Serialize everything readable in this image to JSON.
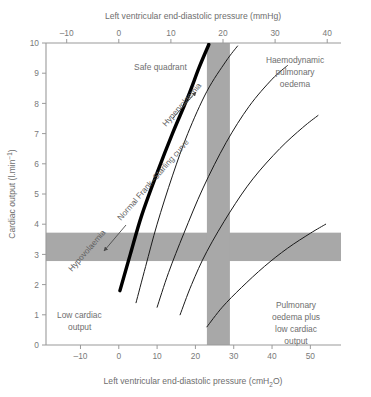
{
  "chart_data": {
    "type": "line",
    "title": "",
    "top_axis": {
      "label": "Left ventricular end-diastolic pressure (mmHg)",
      "ticks": [
        -10,
        0,
        10,
        20,
        30,
        40
      ],
      "range": [
        -14,
        43
      ]
    },
    "bottom_axis": {
      "label": "Left ventricular end-diastolic pressure (cmH₂O)",
      "label_main": "Left ventricular end-diastolic pressure (cmH",
      "label_sub": "2",
      "label_tail": "O)",
      "ticks": [
        -10,
        0,
        10,
        20,
        30,
        40,
        50
      ],
      "range": [
        -19,
        58
      ]
    },
    "ylabel": "Cardiac output (l.min",
    "ylabel_sup": "−1",
    "ylabel_tail": ")",
    "ylabel_full": "Cardiac output (l.min⁻¹)",
    "yticks": [
      0,
      1,
      2,
      3,
      4,
      5,
      6,
      7,
      8,
      9,
      10
    ],
    "ylim": [
      0,
      10
    ],
    "grid": false,
    "legend": "none",
    "bands": {
      "color": "#a8a8a8",
      "horizontal_band": {
        "y_low": 2.78,
        "y_high": 3.72,
        "meaning": "normal cardiac output range"
      },
      "vertical_band": {
        "x_low_cmH2O": 23.0,
        "x_high_cmH2O": 29.0,
        "meaning": "normal LVEDP range"
      }
    },
    "series": [
      {
        "name": "Normal Frank–Starling curve",
        "style": "thick",
        "color": "#000000",
        "width": 3.4,
        "points_cmH2O": [
          [
            0.3,
            1.8
          ],
          [
            3,
            3.0
          ],
          [
            6,
            4.3
          ],
          [
            10,
            5.7
          ],
          [
            14,
            7.0
          ],
          [
            18,
            8.2
          ],
          [
            21,
            9.2
          ],
          [
            23.5,
            9.95
          ]
        ]
      },
      {
        "name": "depressed-curve-1",
        "style": "thin",
        "color": "#1a1a1a",
        "width": 1.0,
        "points_cmH2O": [
          [
            4.5,
            1.4
          ],
          [
            7,
            2.6
          ],
          [
            10,
            4.0
          ],
          [
            14,
            5.6
          ],
          [
            18,
            7.0
          ],
          [
            23,
            8.4
          ],
          [
            28,
            9.4
          ],
          [
            31,
            9.9
          ]
        ]
      },
      {
        "name": "depressed-curve-2",
        "style": "thin",
        "color": "#1a1a1a",
        "width": 1.0,
        "points_cmH2O": [
          [
            10,
            1.25
          ],
          [
            13,
            2.4
          ],
          [
            17,
            3.7
          ],
          [
            22,
            5.2
          ],
          [
            28,
            6.7
          ],
          [
            34,
            7.9
          ],
          [
            40,
            8.8
          ],
          [
            44,
            9.25
          ]
        ]
      },
      {
        "name": "depressed-curve-3",
        "style": "thin",
        "color": "#1a1a1a",
        "width": 1.0,
        "points_cmH2O": [
          [
            16,
            1.0
          ],
          [
            19,
            2.0
          ],
          [
            23,
            3.1
          ],
          [
            29,
            4.4
          ],
          [
            35,
            5.5
          ],
          [
            42,
            6.5
          ],
          [
            48,
            7.2
          ],
          [
            52,
            7.6
          ]
        ]
      },
      {
        "name": "depressed-curve-4",
        "style": "thin",
        "color": "#1a1a1a",
        "width": 1.0,
        "points_cmH2O": [
          [
            23,
            0.6
          ],
          [
            27,
            1.25
          ],
          [
            32,
            1.9
          ],
          [
            38,
            2.6
          ],
          [
            44,
            3.2
          ],
          [
            50,
            3.7
          ],
          [
            54,
            4.0
          ]
        ]
      }
    ],
    "annotations": [
      {
        "name": "safe-quadrant",
        "text": "Safe quadrant",
        "x_cmH2O": 4,
        "y": 9.1
      },
      {
        "name": "haemodynamic-pulmonary-oedema",
        "lines": [
          "Haemodynamic",
          "pulmonary",
          "oedema"
        ],
        "x_cmH2O": 34,
        "y": 9.2
      },
      {
        "name": "low-cardiac-output",
        "lines": [
          "Low cardiac",
          "output"
        ],
        "x_cmH2O": 0,
        "y": 1.2
      },
      {
        "name": "pulmonary-oedema-plus-low-cardiac-output",
        "lines": [
          "Pulmonary",
          "oedema plus",
          "low cardiac",
          "output"
        ],
        "x_cmH2O": 44,
        "y": 1.9
      },
      {
        "name": "normal-frank-starling-curve-label",
        "text": "Normal Frank–Starling curve",
        "rotation_deg": -49
      },
      {
        "name": "hypervolaemia-label",
        "text": "Hypervolaemia",
        "rotation_deg": -49,
        "arrow": "down-right"
      },
      {
        "name": "hypovolaemia-label",
        "text": "Hypovolaemia",
        "rotation_deg": -49,
        "arrow": "down-left"
      }
    ]
  },
  "figure": {
    "top_axis_label": "Left ventricular end-diastolic pressure (mmHg)",
    "bottom_axis_label_main": "Left ventricular end-diastolic pressure (cmH",
    "bottom_axis_label_sub": "2",
    "bottom_axis_label_tail": "O)",
    "y_axis_label_main": "Cardiac output (l.min",
    "y_axis_label_sup": "−1",
    "y_axis_label_tail": ")",
    "labels": {
      "safe_quadrant": "Safe quadrant",
      "haemo_l1": "Haemodynamic",
      "haemo_l2": "pulmonary",
      "haemo_l3": "oedema",
      "lowco_l1": "Low cardiac",
      "lowco_l2": "output",
      "poplco_l1": "Pulmonary",
      "poplco_l2": "oedema plus",
      "poplco_l3": "low cardiac",
      "poplco_l4": "output",
      "normal_curve": "Normal Frank–Starling curve",
      "hypervolaemia": "Hypervolaemia",
      "hypovolaemia": "Hypovolaemia"
    },
    "ticks": {
      "top": [
        "–10",
        "0",
        "10",
        "20",
        "30",
        "40"
      ],
      "bottom": [
        "–10",
        "0",
        "10",
        "20",
        "30",
        "40",
        "50"
      ],
      "left": [
        "10",
        "9",
        "8",
        "7",
        "6",
        "5",
        "4",
        "3",
        "2",
        "1",
        "0"
      ]
    },
    "colors": {
      "band": "#a8a8a8",
      "axis": "#9a9a9a",
      "text": "#6e6e6e",
      "curve_main": "#000000",
      "curve_thin": "#1a1a1a"
    }
  }
}
